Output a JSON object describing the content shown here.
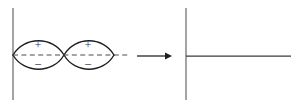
{
  "figure": {
    "background_color": "#ffffff",
    "width": 300,
    "height": 106,
    "ink_color": "#1d1d1f",
    "axis_color": "#58585a",
    "dashed_color": "#4d4d50"
  },
  "left_panel": {
    "axis": {
      "label": "vertical-axis",
      "x": 13,
      "y_top": 8,
      "y_bottom": 100
    },
    "nodal_axis": {
      "label": "dashed-nodal-axis",
      "x_start": 13,
      "x_end": 129,
      "y": 55,
      "style": "dashed"
    },
    "lobes": [
      {
        "name": "left-orbital-lobe",
        "x_start": 13,
        "x_end": 64,
        "center_x": 38,
        "center_y": 55,
        "upper_sign": "+",
        "lower_sign": "–"
      },
      {
        "name": "right-orbital-lobe",
        "x_start": 64,
        "x_end": 114,
        "center_x": 88,
        "center_y": 55,
        "upper_sign": "+",
        "lower_sign": "–"
      }
    ],
    "signs": {
      "plus": "+",
      "minus": "–"
    }
  },
  "arrow": {
    "name": "transformation-arrow",
    "direction": "right",
    "x_start": 137,
    "x_end": 172,
    "y": 56,
    "label": ""
  },
  "right_panel": {
    "axis": {
      "label": "vertical-axis",
      "x": 186,
      "y_top": 8,
      "y_bottom": 100
    },
    "node_line": {
      "label": "horizontal-node-line",
      "x_start": 186,
      "x_end": 291,
      "y": 56
    }
  }
}
